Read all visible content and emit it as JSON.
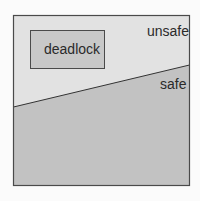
{
  "diagram": {
    "regions": {
      "unsafe": {
        "label": "unsafe",
        "fill": "#e2e2e2"
      },
      "safe": {
        "label": "safe",
        "fill": "#c2c2c2"
      },
      "deadlock": {
        "label": "deadlock",
        "fill": "#c8c8c8"
      }
    },
    "colors": {
      "border": "#4a4a4a",
      "divider": "#333333",
      "background": "#fbfbfb"
    }
  }
}
